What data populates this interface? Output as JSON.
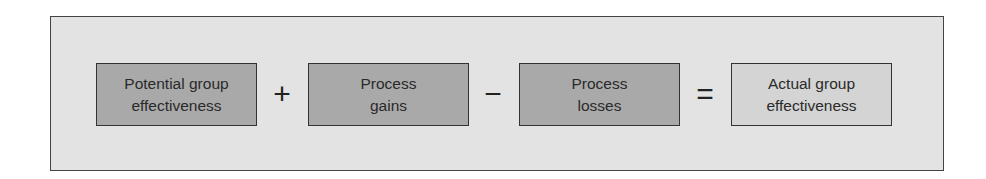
{
  "diagram": {
    "terms": [
      {
        "label": "Potential group effectiveness",
        "line1": "Potential group",
        "line2": "effectiveness"
      },
      {
        "label": "Process gains",
        "line1": "Process",
        "line2": "gains"
      },
      {
        "label": "Process losses",
        "line1": "Process",
        "line2": "losses"
      },
      {
        "label": "Actual group effectiveness",
        "line1": "Actual group",
        "line2": "effectiveness"
      }
    ],
    "operators": [
      "+",
      "−",
      "="
    ]
  }
}
